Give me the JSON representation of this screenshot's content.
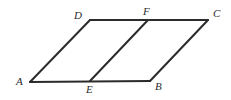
{
  "figure": {
    "kind": "geometry-diagram",
    "canvas": {
      "width": 231,
      "height": 100
    },
    "background_color": "#ffffff",
    "stroke_color": "#2b2b2b",
    "stroke_width": 2,
    "label_color": "#2b2b2b",
    "vertices": [
      {
        "id": "A",
        "label": "A",
        "x": 30,
        "y": 82,
        "label_x": 16,
        "label_y": 76
      },
      {
        "id": "E",
        "label": "E",
        "x": 90,
        "y": 81,
        "label_x": 86,
        "label_y": 84
      },
      {
        "id": "B",
        "label": "B",
        "x": 150,
        "y": 81,
        "label_x": 155,
        "label_y": 81
      },
      {
        "id": "C",
        "label": "C",
        "x": 208,
        "y": 20,
        "label_x": 213,
        "label_y": 8
      },
      {
        "id": "F",
        "label": "F",
        "x": 148,
        "y": 20,
        "label_x": 143,
        "label_y": 6
      },
      {
        "id": "D",
        "label": "D",
        "x": 90,
        "y": 20,
        "label_x": 74,
        "label_y": 10
      }
    ],
    "segments": [
      {
        "id": "AB",
        "from": "A",
        "to": "B"
      },
      {
        "id": "BC",
        "from": "B",
        "to": "C"
      },
      {
        "id": "CD",
        "from": "C",
        "to": "D"
      },
      {
        "id": "DA",
        "from": "D",
        "to": "A"
      },
      {
        "id": "EF",
        "from": "E",
        "to": "F"
      }
    ]
  }
}
